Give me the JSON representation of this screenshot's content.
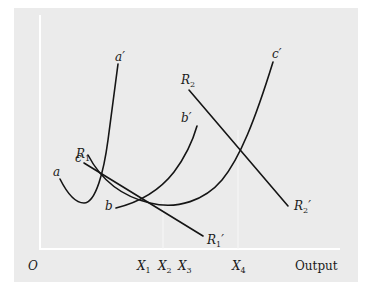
{
  "diagram": {
    "type": "cost-and-revenue-curves",
    "axis": {
      "origin_label": "O",
      "x_axis_label": "Output",
      "x_ticks": [
        {
          "label": "X",
          "sub": "1"
        },
        {
          "label": "X",
          "sub": "2"
        },
        {
          "label": "X",
          "sub": "3"
        },
        {
          "label": "X",
          "sub": "4"
        }
      ]
    },
    "curves": [
      {
        "id": "aa",
        "start_label": "a",
        "end_label": "a′"
      },
      {
        "id": "bb",
        "start_label": "b",
        "end_label": "b′"
      },
      {
        "id": "cc",
        "start_label": "c",
        "end_label": "c′"
      },
      {
        "id": "R1",
        "start_label": "R",
        "start_sub": "1",
        "end_label": "R",
        "end_sub": "1",
        "end_prime": "′"
      },
      {
        "id": "R2",
        "start_label": "R",
        "start_sub": "2",
        "end_label": "R",
        "end_sub": "2",
        "end_prime": "′"
      }
    ],
    "colors": {
      "background": "#ebebeb",
      "curve": "#151515",
      "axis": "#ffffff"
    }
  }
}
